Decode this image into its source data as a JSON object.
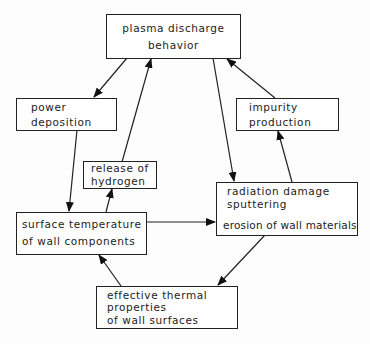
{
  "diagram": {
    "nodes": {
      "plasma": {
        "line1": "plasma  discharge",
        "line2": "behavior"
      },
      "power": {
        "line1": "power",
        "line2": "deposition"
      },
      "impurity": {
        "line1": "impurity",
        "line2": "production"
      },
      "hydrogen": {
        "line1": "release of",
        "line2": "hydrogen"
      },
      "surface": {
        "line1": "surface temperature",
        "line2": "of wall components"
      },
      "radiation": {
        "line1": "radiation damage",
        "line2": "sputtering",
        "line3": "erosion of wall materials"
      },
      "thermal": {
        "line1": "effective thermal",
        "line2": "properties",
        "line3": "of wall surfaces"
      }
    },
    "edges": [
      {
        "from": "plasma",
        "to": "power"
      },
      {
        "from": "power",
        "to": "surface"
      },
      {
        "from": "surface",
        "to": "hydrogen"
      },
      {
        "from": "hydrogen",
        "to": "plasma"
      },
      {
        "from": "plasma",
        "to": "radiation"
      },
      {
        "from": "radiation",
        "to": "impurity"
      },
      {
        "from": "impurity",
        "to": "plasma"
      },
      {
        "from": "surface",
        "to": "radiation"
      },
      {
        "from": "radiation",
        "to": "thermal"
      },
      {
        "from": "thermal",
        "to": "surface"
      }
    ]
  }
}
